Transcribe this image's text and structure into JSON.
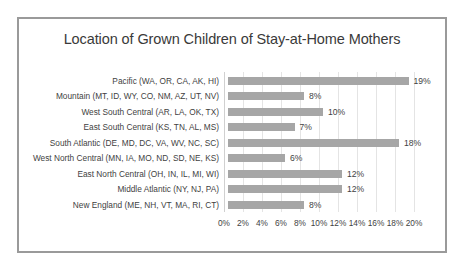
{
  "chart_data": {
    "type": "bar",
    "orientation": "horizontal",
    "title": "Location of Grown Children of Stay-at-Home Mothers",
    "xlabel": "",
    "ylabel": "",
    "xlim": [
      0,
      20
    ],
    "grid": true,
    "legend": false,
    "value_suffix": "%",
    "categories": [
      "Pacific (WA, OR, CA, AK, HI)",
      "Mountain (MT, ID, WY, CO, NM, AZ, UT, NV)",
      "West South Central (AR, LA, OK, TX)",
      "East South Central (KS, TN, AL, MS)",
      "South Atlantic (DE, MD, DC, VA, WV, NC, SC)",
      "West North Central (MN, IA, MO, ND, SD, NE, KS)",
      "East North Central (OH, IN, IL, MI, WI)",
      "Middle Atlantic (NY, NJ, PA)",
      "New England (ME, NH, VT, MA, RI, CT)"
    ],
    "values": [
      19,
      8,
      10,
      7,
      18,
      6,
      12,
      12,
      8
    ],
    "value_labels": [
      "19%",
      "8%",
      "10%",
      "7%",
      "18%",
      "6%",
      "12%",
      "12%",
      "8%"
    ],
    "xticks": [
      0,
      2,
      4,
      6,
      8,
      10,
      12,
      14,
      16,
      18,
      20
    ],
    "xtick_labels": [
      "0%",
      "2%",
      "4%",
      "6%",
      "8%",
      "10%",
      "12%",
      "14%",
      "16%",
      "18%",
      "20%"
    ],
    "colors": {
      "bar": "#a6a6a6",
      "gridline": "#e4e4e4",
      "border": "#9a9a9a",
      "text": "#3f3f3f",
      "title_text": "#3a3a3a",
      "background": "#ffffff"
    }
  }
}
